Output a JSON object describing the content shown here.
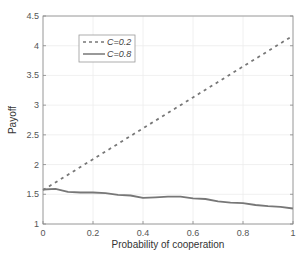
{
  "chart_data": {
    "type": "line",
    "title": "",
    "xlabel": "Probability of cooperation",
    "ylabel": "Payoff",
    "xlim": [
      0,
      1
    ],
    "ylim": [
      1,
      4.5
    ],
    "xticks": [
      "0",
      "0.2",
      "0.4",
      "0.6",
      "0.8",
      "1"
    ],
    "yticks": [
      "1",
      "1.5",
      "2",
      "2.5",
      "3",
      "3.5",
      "4",
      "4.5"
    ],
    "grid": true,
    "legend_position": "upper-left",
    "series": [
      {
        "name": "C=0.2",
        "style": "dashed",
        "color": "#777777",
        "x": [
          0,
          0.1,
          0.2,
          0.3,
          0.4,
          0.5,
          0.6,
          0.7,
          0.8,
          0.9,
          1.0
        ],
        "values": [
          1.57,
          1.83,
          2.09,
          2.35,
          2.61,
          2.87,
          3.13,
          3.39,
          3.65,
          3.91,
          4.17
        ]
      },
      {
        "name": "C=0.8",
        "style": "solid",
        "color": "#777777",
        "x": [
          0,
          0.05,
          0.1,
          0.15,
          0.2,
          0.25,
          0.3,
          0.35,
          0.4,
          0.45,
          0.5,
          0.55,
          0.6,
          0.65,
          0.7,
          0.75,
          0.8,
          0.85,
          0.9,
          0.95,
          1.0
        ],
        "values": [
          1.58,
          1.59,
          1.54,
          1.53,
          1.53,
          1.52,
          1.49,
          1.48,
          1.44,
          1.45,
          1.46,
          1.46,
          1.43,
          1.42,
          1.38,
          1.36,
          1.35,
          1.32,
          1.3,
          1.29,
          1.26
        ]
      }
    ]
  },
  "legend": {
    "items": [
      {
        "label": "C=0.2"
      },
      {
        "label": "C=0.8"
      }
    ]
  }
}
